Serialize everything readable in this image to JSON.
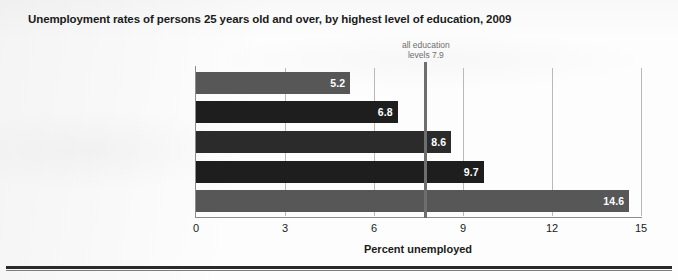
{
  "chart_data": {
    "type": "bar",
    "orientation": "horizontal",
    "title": "Unemployment rates of persons 25 years old and over, by highest level of education, 2009",
    "xlabel": "Percent unemployed",
    "ylabel": "",
    "categories": [
      "Bachelor's degree or higher",
      "Associate's degree",
      "Some college, no degree",
      "High school graduate, no college",
      "Less than high school graduate"
    ],
    "values": [
      5.2,
      6.8,
      8.6,
      9.7,
      14.6
    ],
    "value_labels": [
      "5.2",
      "6.8",
      "8.6",
      "9.7",
      "14.6"
    ],
    "bar_colors": [
      "#575757",
      "#1e1e1e",
      "#2b2b2b",
      "#1e1e1e",
      "#575757"
    ],
    "xlim": [
      0,
      15
    ],
    "xticks": [
      0,
      3,
      6,
      9,
      12,
      15
    ],
    "xtick_labels": [
      "0",
      "3",
      "6",
      "9",
      "12",
      "15"
    ],
    "grid": true,
    "legend": false,
    "annotations": [
      {
        "name": "all-education-levels-reference",
        "text_line1": "all education",
        "text_line2": "levels 7.9",
        "value": 7.9,
        "color": "#6e6e6e"
      }
    ]
  }
}
